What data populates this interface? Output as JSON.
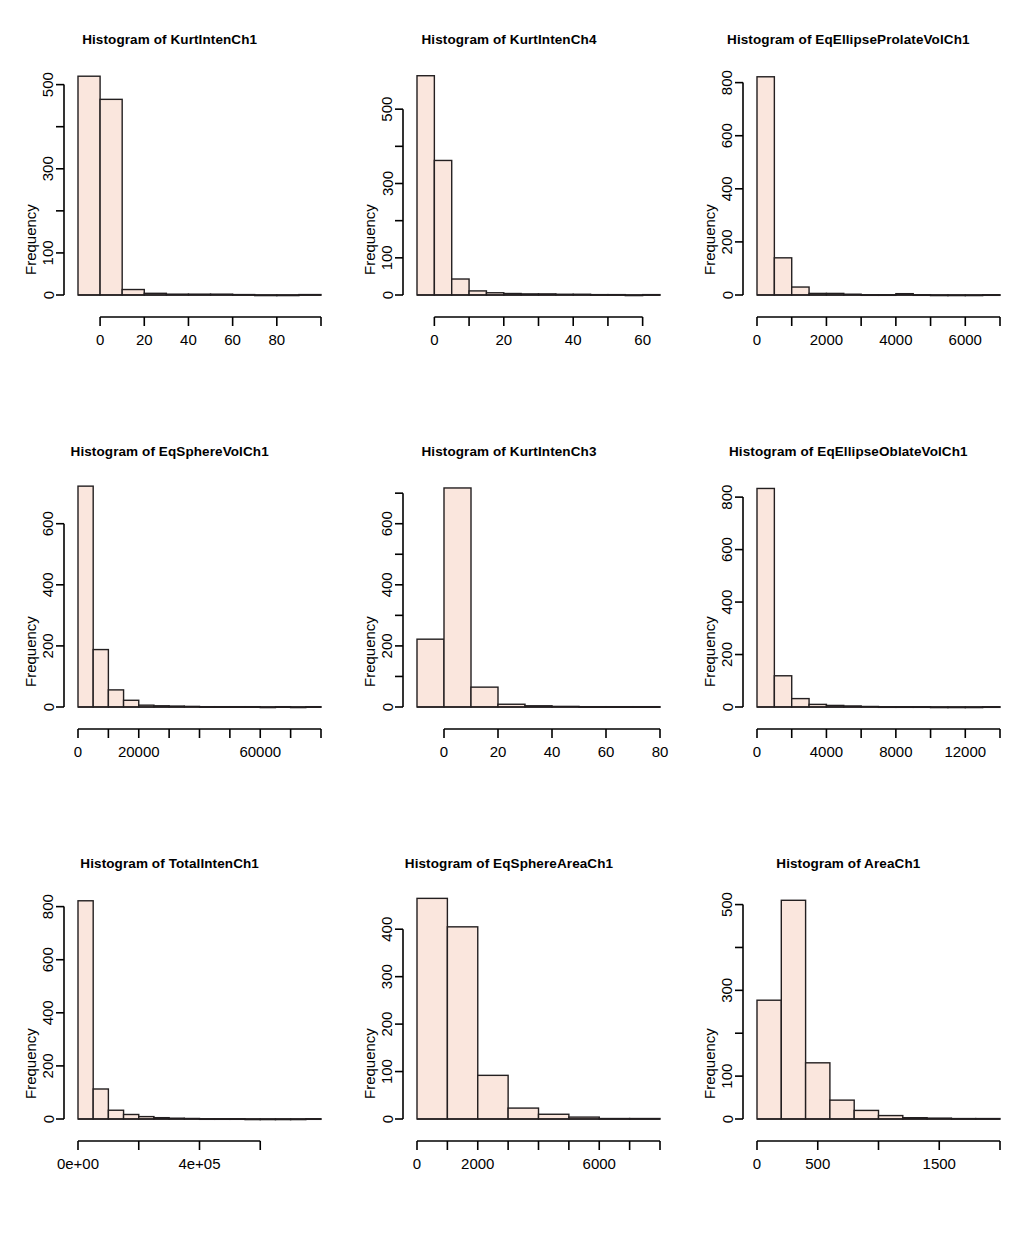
{
  "figure": {
    "layout": "3x3 grid of histograms",
    "bar_fill": "#fae6dd",
    "bar_stroke": "#231f20",
    "background": "#ffffff",
    "ylabel": "Frequency",
    "title_prefix": "Histogram of"
  },
  "chart_data": [
    {
      "type": "bar",
      "title": "Histogram of  KurtIntenCh1",
      "variable": "KurtIntenCh1",
      "xlabel": "",
      "ylabel": "Frequency",
      "xlim": [
        -10,
        100
      ],
      "ylim": [
        0,
        530
      ],
      "xticks": [
        0,
        20,
        40,
        60,
        80,
        100
      ],
      "xticklabels": [
        "0",
        "20",
        "40",
        "60",
        "80",
        ""
      ],
      "yticks": [
        0,
        100,
        200,
        300,
        400,
        500
      ],
      "yticklabels": [
        "0",
        "100",
        "",
        "300",
        "",
        "500"
      ],
      "bin_width": 10,
      "bin_starts": [
        -10,
        0,
        10,
        20,
        30,
        40,
        50,
        60,
        70,
        80,
        90
      ],
      "values": [
        520,
        465,
        13,
        4,
        2,
        2,
        2,
        1,
        0,
        0,
        1
      ],
      "grid": false,
      "legend": false
    },
    {
      "type": "bar",
      "title": "Histogram of  KurtIntenCh4",
      "variable": "KurtIntenCh4",
      "xlabel": "",
      "ylabel": "Frequency",
      "xlim": [
        -5,
        65
      ],
      "ylim": [
        0,
        600
      ],
      "xticks": [
        0,
        10,
        20,
        30,
        40,
        50,
        60
      ],
      "xticklabels": [
        "0",
        "",
        "20",
        "",
        "40",
        "",
        "60"
      ],
      "yticks": [
        0,
        100,
        200,
        300,
        400,
        500
      ],
      "yticklabels": [
        "0",
        "100",
        "",
        "300",
        "",
        "500"
      ],
      "bin_width": 5,
      "bin_starts": [
        -5,
        0,
        5,
        10,
        15,
        20,
        25,
        30,
        35,
        40,
        45,
        50,
        55,
        60
      ],
      "values": [
        590,
        362,
        43,
        11,
        6,
        4,
        3,
        3,
        2,
        2,
        1,
        1,
        0,
        1
      ],
      "grid": false,
      "legend": false
    },
    {
      "type": "bar",
      "title": "Histogram of  EqEllipseProlateVolCh1",
      "variable": "EqEllipseProlateVolCh1",
      "xlabel": "",
      "ylabel": "Frequency",
      "xlim": [
        0,
        7000
      ],
      "ylim": [
        0,
        840
      ],
      "xticks": [
        0,
        1000,
        2000,
        3000,
        4000,
        5000,
        6000,
        7000
      ],
      "xticklabels": [
        "0",
        "",
        "2000",
        "",
        "4000",
        "",
        "6000",
        ""
      ],
      "yticks": [
        0,
        200,
        400,
        600,
        800
      ],
      "yticklabels": [
        "0",
        "200",
        "400",
        "600",
        "800"
      ],
      "bin_width": 500,
      "bin_starts": [
        0,
        500,
        1000,
        1500,
        2000,
        2500,
        3000,
        3500,
        4000,
        4500,
        5000,
        5500,
        6000,
        6500
      ],
      "values": [
        822,
        140,
        30,
        6,
        6,
        3,
        1,
        1,
        5,
        1,
        0,
        0,
        0,
        1
      ],
      "grid": false,
      "legend": false
    },
    {
      "type": "bar",
      "title": "Histogram of  EqSphereVolCh1",
      "variable": "EqSphereVolCh1",
      "xlabel": "",
      "ylabel": "Frequency",
      "xlim": [
        0,
        80000
      ],
      "ylim": [
        0,
        730
      ],
      "xticks": [
        0,
        10000,
        20000,
        30000,
        40000,
        50000,
        60000,
        70000,
        80000
      ],
      "xticklabels": [
        "0",
        "",
        "20000",
        "",
        "",
        "",
        "60000",
        "",
        ""
      ],
      "yticks": [
        0,
        200,
        400,
        600
      ],
      "yticklabels": [
        "0",
        "200",
        "400",
        "600"
      ],
      "bin_width": 5000,
      "bin_starts": [
        0,
        5000,
        10000,
        15000,
        20000,
        25000,
        30000,
        35000,
        40000,
        45000,
        50000,
        55000,
        60000,
        65000,
        70000,
        75000
      ],
      "values": [
        723,
        188,
        56,
        22,
        6,
        4,
        3,
        2,
        1,
        1,
        1,
        1,
        0,
        1,
        0,
        1
      ],
      "grid": false,
      "legend": false
    },
    {
      "type": "bar",
      "title": "Histogram of  KurtIntenCh3",
      "variable": "KurtIntenCh3",
      "xlabel": "",
      "ylabel": "Frequency",
      "xlim": [
        -10,
        80
      ],
      "ylim": [
        0,
        730
      ],
      "xticks": [
        0,
        20,
        40,
        60,
        80
      ],
      "xticklabels": [
        "0",
        "20",
        "40",
        "60",
        "80"
      ],
      "yticks": [
        0,
        100,
        200,
        300,
        400,
        500,
        600,
        700
      ],
      "yticklabels": [
        "0",
        "",
        "200",
        "",
        "400",
        "",
        "600",
        ""
      ],
      "bin_width": 10,
      "bin_starts": [
        -10,
        0,
        10,
        20,
        30,
        40,
        50,
        60,
        70
      ],
      "values": [
        222,
        717,
        65,
        9,
        4,
        2,
        1,
        1,
        1
      ],
      "grid": false,
      "legend": false
    },
    {
      "type": "bar",
      "title": "Histogram of  EqEllipseOblateVolCh1",
      "variable": "EqEllipseOblateVolCh1",
      "xlabel": "",
      "ylabel": "Frequency",
      "xlim": [
        0,
        14000
      ],
      "ylim": [
        0,
        850
      ],
      "xticks": [
        0,
        2000,
        4000,
        6000,
        8000,
        10000,
        12000,
        14000
      ],
      "xticklabels": [
        "0",
        "",
        "4000",
        "",
        "8000",
        "",
        "12000",
        ""
      ],
      "yticks": [
        0,
        200,
        400,
        600,
        800
      ],
      "yticklabels": [
        "0",
        "200",
        "400",
        "600",
        "800"
      ],
      "bin_width": 1000,
      "bin_starts": [
        0,
        1000,
        2000,
        3000,
        4000,
        5000,
        6000,
        7000,
        8000,
        9000,
        10000,
        11000,
        12000,
        13000
      ],
      "values": [
        833,
        119,
        32,
        10,
        6,
        4,
        2,
        1,
        1,
        1,
        0,
        0,
        0,
        1
      ],
      "grid": false,
      "legend": false
    },
    {
      "type": "bar",
      "title": "Histogram of  TotalIntenCh1",
      "variable": "TotalIntenCh1",
      "xlabel": "",
      "ylabel": "Frequency",
      "xlim": [
        0,
        800000
      ],
      "ylim": [
        0,
        840
      ],
      "xticks": [
        0,
        200000,
        400000,
        600000
      ],
      "xticklabels": [
        "0e+00",
        "",
        "4e+05",
        ""
      ],
      "yticks": [
        0,
        200,
        400,
        600,
        800
      ],
      "yticklabels": [
        "0",
        "200",
        "400",
        "600",
        "800"
      ],
      "bin_width": 50000,
      "bin_starts": [
        0,
        50000,
        100000,
        150000,
        200000,
        250000,
        300000,
        350000,
        400000,
        450000,
        500000,
        550000,
        600000,
        650000,
        700000,
        750000
      ],
      "values": [
        822,
        113,
        33,
        17,
        9,
        5,
        3,
        2,
        1,
        1,
        1,
        0,
        0,
        0,
        0,
        1
      ],
      "grid": false,
      "legend": false
    },
    {
      "type": "bar",
      "title": "Histogram of  EqSphereAreaCh1",
      "variable": "EqSphereAreaCh1",
      "xlabel": "",
      "ylabel": "Frequency",
      "xlim": [
        0,
        8000
      ],
      "ylim": [
        0,
        470
      ],
      "xticks": [
        0,
        1000,
        2000,
        3000,
        4000,
        5000,
        6000,
        7000,
        8000
      ],
      "xticklabels": [
        "0",
        "",
        "2000",
        "",
        "",
        "",
        "6000",
        "",
        ""
      ],
      "yticks": [
        0,
        100,
        200,
        300,
        400
      ],
      "yticklabels": [
        "0",
        "100",
        "200",
        "300",
        "400"
      ],
      "bin_width": 1000,
      "bin_starts": [
        0,
        1000,
        2000,
        3000,
        4000,
        5000,
        6000,
        7000
      ],
      "values": [
        465,
        405,
        92,
        23,
        10,
        4,
        1,
        1
      ],
      "grid": false,
      "legend": false
    },
    {
      "type": "bar",
      "title": "Histogram of  AreaCh1",
      "variable": "AreaCh1",
      "xlabel": "",
      "ylabel": "Frequency",
      "xlim": [
        0,
        2000
      ],
      "ylim": [
        0,
        520
      ],
      "xticks": [
        0,
        500,
        1000,
        1500,
        2000
      ],
      "xticklabels": [
        "0",
        "500",
        "",
        "1500",
        ""
      ],
      "yticks": [
        0,
        100,
        200,
        300,
        400,
        500
      ],
      "yticklabels": [
        "0",
        "100",
        "",
        "300",
        "",
        "500"
      ],
      "bin_width": 200,
      "bin_starts": [
        0,
        200,
        400,
        600,
        800,
        1000,
        1200,
        1400,
        1600,
        1800
      ],
      "values": [
        277,
        510,
        131,
        44,
        20,
        8,
        3,
        2,
        1,
        1
      ],
      "grid": false,
      "legend": false
    }
  ]
}
